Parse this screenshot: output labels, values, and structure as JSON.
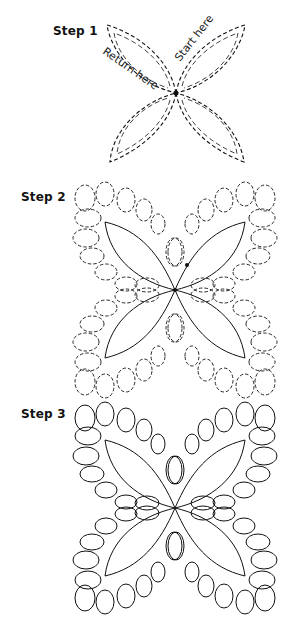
{
  "steps": [
    {
      "label": "Step 1",
      "annotations": {
        "start": "Start here",
        "return": "Return here"
      }
    },
    {
      "label": "Step 2"
    },
    {
      "label": "Step 3"
    }
  ],
  "footer_cutoff_text": "",
  "colors": {
    "line": "#111111",
    "background": "#ffffff"
  }
}
